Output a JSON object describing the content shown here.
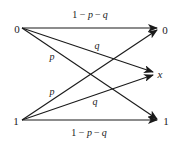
{
  "diagram": {
    "title": "",
    "type": "channel-transition-diagram",
    "inputs": [
      {
        "id": "in0",
        "label": "0",
        "x": 17,
        "y": 29
      },
      {
        "id": "in1",
        "label": "1",
        "x": 16,
        "y": 121
      }
    ],
    "outputs": [
      {
        "id": "out0",
        "label": "0",
        "x": 165,
        "y": 30
      },
      {
        "id": "outx",
        "label": "x",
        "x": 160,
        "y": 74
      },
      {
        "id": "out1",
        "label": "1",
        "x": 166,
        "y": 121
      }
    ],
    "edges": [
      {
        "id": "e00",
        "from": "0",
        "to": "0",
        "x1": 22,
        "y1": 28,
        "x2": 157,
        "y2": 28,
        "label": "1 − p − q",
        "label_x": 90,
        "label_y": 18
      },
      {
        "id": "e0x",
        "from": "0",
        "to": "x",
        "x1": 22,
        "y1": 28,
        "x2": 153,
        "y2": 72,
        "label": "q",
        "label_x": 97,
        "label_y": 49
      },
      {
        "id": "e01",
        "from": "0",
        "to": "1",
        "x1": 22,
        "y1": 28,
        "x2": 157,
        "y2": 119,
        "label": "p",
        "label_x": 52,
        "label_y": 60
      },
      {
        "id": "e10",
        "from": "1",
        "to": "0",
        "x1": 22,
        "y1": 120,
        "x2": 157,
        "y2": 30,
        "label": "p",
        "label_x": 52,
        "label_y": 95
      },
      {
        "id": "e1x",
        "from": "1",
        "to": "x",
        "x1": 22,
        "y1": 120,
        "x2": 153,
        "y2": 75,
        "label": "q",
        "label_x": 95,
        "label_y": 105
      },
      {
        "id": "e11",
        "from": "1",
        "to": "1",
        "x1": 22,
        "y1": 120,
        "x2": 157,
        "y2": 120,
        "label": "1 − p − q",
        "label_x": 89,
        "label_y": 136
      }
    ],
    "colors": {
      "line": "#1a1a1a",
      "background": "#ffffff"
    }
  }
}
